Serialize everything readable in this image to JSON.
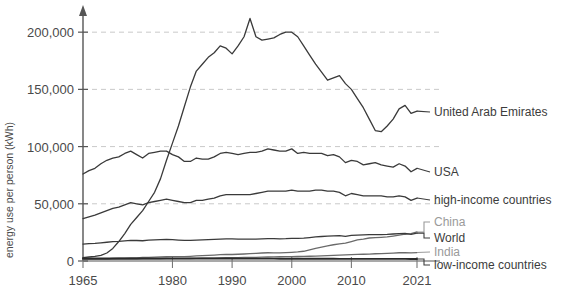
{
  "chart_data": {
    "type": "line",
    "title": "",
    "xlabel": "",
    "ylabel": "energy use per person (kWh)",
    "xlim": [
      1965,
      2021
    ],
    "ylim": [
      0,
      215000
    ],
    "grid": true,
    "legend_position": "right-inline",
    "xticks": [
      1965,
      1980,
      1990,
      2000,
      2010,
      2021
    ],
    "xtick_labels": [
      "1965",
      "1980",
      "1990",
      "2000",
      "2010",
      "2021"
    ],
    "yticks": [
      0,
      50000,
      100000,
      150000,
      200000
    ],
    "ytick_labels": [
      "0",
      "50,000",
      "100,000",
      "150,000",
      "200,000"
    ],
    "series": [
      {
        "name": "United Arab Emirates",
        "label": "United Arab Emirates",
        "color": "#3a3a3a",
        "label_color": "#3c3c3c",
        "x": [
          1965,
          1966,
          1967,
          1968,
          1969,
          1970,
          1971,
          1972,
          1973,
          1974,
          1975,
          1976,
          1977,
          1978,
          1979,
          1980,
          1981,
          1982,
          1983,
          1984,
          1985,
          1986,
          1987,
          1988,
          1989,
          1990,
          1991,
          1992,
          1993,
          1994,
          1995,
          1996,
          1997,
          1998,
          1999,
          2000,
          2001,
          2002,
          2003,
          2004,
          2005,
          2006,
          2007,
          2008,
          2009,
          2010,
          2011,
          2012,
          2013,
          2014,
          2015,
          2016,
          2017,
          2018,
          2019,
          2020,
          2021
        ],
        "values": [
          3000,
          3500,
          4000,
          5000,
          7000,
          11000,
          17000,
          24000,
          32000,
          38000,
          44000,
          52000,
          60000,
          72000,
          88000,
          103000,
          118000,
          135000,
          152000,
          166000,
          172000,
          178000,
          182000,
          188000,
          186000,
          181000,
          188000,
          196000,
          212000,
          196000,
          193000,
          194000,
          195000,
          198000,
          200000,
          200000,
          196000,
          188000,
          180000,
          172000,
          165000,
          158000,
          160000,
          162000,
          155000,
          150000,
          142000,
          134000,
          124000,
          114000,
          113000,
          118000,
          124000,
          133000,
          136000,
          129000,
          131000
        ]
      },
      {
        "name": "USA",
        "label": "USA",
        "color": "#3a3a3a",
        "label_color": "#3c3c3c",
        "x": [
          1965,
          1966,
          1967,
          1968,
          1969,
          1970,
          1971,
          1972,
          1973,
          1974,
          1975,
          1976,
          1977,
          1978,
          1979,
          1980,
          1981,
          1982,
          1983,
          1984,
          1985,
          1986,
          1987,
          1988,
          1989,
          1990,
          1991,
          1992,
          1993,
          1994,
          1995,
          1996,
          1997,
          1998,
          1999,
          2000,
          2001,
          2002,
          2003,
          2004,
          2005,
          2006,
          2007,
          2008,
          2009,
          2010,
          2011,
          2012,
          2013,
          2014,
          2015,
          2016,
          2017,
          2018,
          2019,
          2020,
          2021
        ],
        "values": [
          76000,
          79000,
          81000,
          85000,
          88000,
          90000,
          91000,
          94000,
          96000,
          93000,
          90000,
          94000,
          95000,
          96000,
          96000,
          93000,
          91000,
          87000,
          87000,
          90000,
          89000,
          89000,
          91000,
          94000,
          95000,
          94000,
          93000,
          94000,
          95000,
          95000,
          96000,
          98000,
          97000,
          96000,
          96000,
          98000,
          94000,
          95000,
          94000,
          94000,
          94000,
          92000,
          93000,
          91000,
          86000,
          88000,
          87000,
          84000,
          85000,
          86000,
          84000,
          83000,
          82000,
          85000,
          83000,
          78000,
          81000
        ]
      },
      {
        "name": "high-income countries",
        "label": "high-income countries",
        "color": "#3a3a3a",
        "label_color": "#3c3c3c",
        "x": [
          1965,
          1966,
          1967,
          1968,
          1969,
          1970,
          1971,
          1972,
          1973,
          1974,
          1975,
          1976,
          1977,
          1978,
          1979,
          1980,
          1981,
          1982,
          1983,
          1984,
          1985,
          1986,
          1987,
          1988,
          1989,
          1990,
          1991,
          1992,
          1993,
          1994,
          1995,
          1996,
          1997,
          1998,
          1999,
          2000,
          2001,
          2002,
          2003,
          2004,
          2005,
          2006,
          2007,
          2008,
          2009,
          2010,
          2011,
          2012,
          2013,
          2014,
          2015,
          2016,
          2017,
          2018,
          2019,
          2020,
          2021
        ],
        "values": [
          37000,
          38500,
          40000,
          42000,
          44000,
          46000,
          47000,
          49000,
          51000,
          50000,
          49000,
          51000,
          52000,
          53000,
          54000,
          53000,
          52000,
          51000,
          51000,
          53000,
          53000,
          54000,
          55000,
          57000,
          58000,
          58000,
          58000,
          58000,
          58000,
          59000,
          60000,
          61000,
          61000,
          61000,
          61000,
          62000,
          61000,
          61000,
          61000,
          62000,
          62000,
          61000,
          61000,
          60000,
          57000,
          59000,
          58000,
          57000,
          57000,
          57000,
          57000,
          56000,
          56000,
          57000,
          56000,
          53000,
          55000
        ]
      },
      {
        "name": "China",
        "label": "China",
        "color": "#6a6a6a",
        "label_color": "#9a9a9a",
        "x": [
          1965,
          1966,
          1967,
          1968,
          1969,
          1970,
          1971,
          1972,
          1973,
          1974,
          1975,
          1976,
          1977,
          1978,
          1979,
          1980,
          1981,
          1982,
          1983,
          1984,
          1985,
          1986,
          1987,
          1988,
          1989,
          1990,
          1991,
          1992,
          1993,
          1994,
          1995,
          1996,
          1997,
          1998,
          1999,
          2000,
          2001,
          2002,
          2003,
          2004,
          2005,
          2006,
          2007,
          2008,
          2009,
          2010,
          2011,
          2012,
          2013,
          2014,
          2015,
          2016,
          2017,
          2018,
          2019,
          2020,
          2021
        ],
        "values": [
          1500,
          1600,
          1500,
          1700,
          1900,
          2200,
          2400,
          2500,
          2700,
          2800,
          3100,
          3100,
          3300,
          3600,
          3700,
          3800,
          3800,
          3900,
          4100,
          4400,
          4700,
          4900,
          5200,
          5500,
          5700,
          5700,
          5900,
          6100,
          6400,
          6700,
          7000,
          7200,
          7100,
          7100,
          7300,
          7600,
          7900,
          8500,
          9700,
          11000,
          12100,
          13200,
          14200,
          14900,
          15600,
          17000,
          18500,
          19200,
          20100,
          20500,
          20700,
          21000,
          21800,
          22700,
          23400,
          23900,
          25400
        ]
      },
      {
        "name": "World",
        "label": "World",
        "color": "#3a3a3a",
        "label_color": "#3c3c3c",
        "x": [
          1965,
          1966,
          1967,
          1968,
          1969,
          1970,
          1971,
          1972,
          1973,
          1974,
          1975,
          1976,
          1977,
          1978,
          1979,
          1980,
          1981,
          1982,
          1983,
          1984,
          1985,
          1986,
          1987,
          1988,
          1989,
          1990,
          1991,
          1992,
          1993,
          1994,
          1995,
          1996,
          1997,
          1998,
          1999,
          2000,
          2001,
          2002,
          2003,
          2004,
          2005,
          2006,
          2007,
          2008,
          2009,
          2010,
          2011,
          2012,
          2013,
          2014,
          2015,
          2016,
          2017,
          2018,
          2019,
          2020,
          2021
        ],
        "values": [
          14800,
          15200,
          15400,
          15900,
          16400,
          17000,
          17200,
          17600,
          18100,
          17900,
          17700,
          18200,
          18400,
          18600,
          18900,
          18600,
          18300,
          18100,
          18000,
          18300,
          18400,
          18600,
          18900,
          19200,
          19400,
          19300,
          19200,
          19100,
          19100,
          19200,
          19400,
          19600,
          19500,
          19400,
          19500,
          19800,
          19800,
          20000,
          20500,
          21100,
          21400,
          21700,
          22000,
          22100,
          21600,
          22400,
          22700,
          22800,
          23000,
          23100,
          23100,
          23200,
          23600,
          24000,
          24100,
          23300,
          24400
        ]
      },
      {
        "name": "India",
        "label": "India",
        "color": "#6a6a6a",
        "label_color": "#9a9a9a",
        "x": [
          1965,
          1966,
          1967,
          1968,
          1969,
          1970,
          1971,
          1972,
          1973,
          1974,
          1975,
          1976,
          1977,
          1978,
          1979,
          1980,
          1981,
          1982,
          1983,
          1984,
          1985,
          1986,
          1987,
          1988,
          1989,
          1990,
          1991,
          1992,
          1993,
          1994,
          1995,
          1996,
          1997,
          1998,
          1999,
          2000,
          2001,
          2002,
          2003,
          2004,
          2005,
          2006,
          2007,
          2008,
          2009,
          2010,
          2011,
          2012,
          2013,
          2014,
          2015,
          2016,
          2017,
          2018,
          2019,
          2020,
          2021
        ],
        "values": [
          1400,
          1450,
          1450,
          1500,
          1550,
          1600,
          1650,
          1700,
          1700,
          1750,
          1800,
          1850,
          1900,
          1950,
          2000,
          2000,
          2100,
          2150,
          2200,
          2300,
          2400,
          2500,
          2600,
          2700,
          2850,
          2950,
          3000,
          3100,
          3150,
          3250,
          3400,
          3500,
          3600,
          3700,
          3850,
          3900,
          3950,
          4050,
          4150,
          4300,
          4450,
          4650,
          4900,
          5050,
          5300,
          5550,
          5750,
          5900,
          6050,
          6350,
          6500,
          6700,
          6950,
          7200,
          7300,
          7100,
          7400
        ]
      },
      {
        "name": "low-income countries",
        "label": "low-income countries",
        "color": "#2a2a2a",
        "label_color": "#3c3c3c",
        "x": [
          1965,
          1966,
          1967,
          1968,
          1969,
          1970,
          1971,
          1972,
          1973,
          1974,
          1975,
          1976,
          1977,
          1978,
          1979,
          1980,
          1981,
          1982,
          1983,
          1984,
          1985,
          1986,
          1987,
          1988,
          1989,
          1990,
          1991,
          1992,
          1993,
          1994,
          1995,
          1996,
          1997,
          1998,
          1999,
          2000,
          2001,
          2002,
          2003,
          2004,
          2005,
          2006,
          2007,
          2008,
          2009,
          2010,
          2011,
          2012,
          2013,
          2014,
          2015,
          2016,
          2017,
          2018,
          2019,
          2020,
          2021
        ],
        "values": [
          2200,
          2200,
          2200,
          2200,
          2200,
          2250,
          2250,
          2250,
          2250,
          2250,
          2250,
          2250,
          2250,
          2250,
          2250,
          2250,
          2250,
          2250,
          2250,
          2250,
          2200,
          2200,
          2200,
          2200,
          2200,
          2150,
          2150,
          2100,
          2100,
          2100,
          2050,
          2050,
          2050,
          2000,
          2000,
          2000,
          1980,
          1960,
          1950,
          1950,
          1950,
          1930,
          1920,
          1900,
          1900,
          1900,
          1880,
          1870,
          1860,
          1850,
          1850,
          1840,
          1830,
          1830,
          1820,
          1780,
          1800
        ]
      }
    ]
  },
  "axis": {
    "y_axis_title": "energy use per person (kWh)"
  }
}
